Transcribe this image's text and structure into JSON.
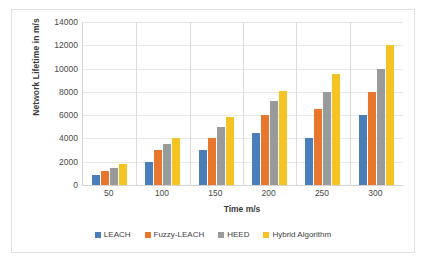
{
  "chart_data": {
    "type": "bar",
    "title": "",
    "xlabel": "Time m/s",
    "ylabel": "Network Lifetime in m/s",
    "categories": [
      "50",
      "100",
      "150",
      "200",
      "250",
      "300"
    ],
    "ylim": [
      0,
      14000
    ],
    "yticks": [
      0,
      2000,
      4000,
      6000,
      8000,
      10000,
      12000,
      14000
    ],
    "grid": true,
    "legend_position": "bottom",
    "series": [
      {
        "name": "LEACH",
        "color": "#4a7ebb",
        "values": [
          900,
          2000,
          3000,
          4500,
          4000,
          6000
        ]
      },
      {
        "name": "Fuzzy-LEACH",
        "color": "#e8762c",
        "values": [
          1200,
          3000,
          4000,
          6000,
          6500,
          8000
        ]
      },
      {
        "name": "HEED",
        "color": "#9a9a9a",
        "values": [
          1500,
          3500,
          5000,
          7200,
          8000,
          10000
        ]
      },
      {
        "name": "Hybrid Algorithm",
        "color": "#f5c324",
        "values": [
          1800,
          4000,
          5800,
          8100,
          9500,
          12000
        ]
      }
    ]
  }
}
